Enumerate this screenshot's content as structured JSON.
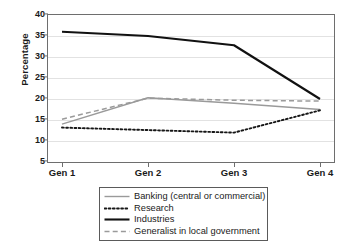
{
  "chart_data": {
    "type": "line",
    "title": "",
    "xlabel": "",
    "ylabel": "Percentage",
    "categories": [
      "Gen 1",
      "Gen 2",
      "Gen 3",
      "Gen 4"
    ],
    "ylim": [
      5,
      40
    ],
    "yticks": [
      5,
      10,
      15,
      20,
      25,
      30,
      35,
      40
    ],
    "ytick_labels": [
      "5",
      "10",
      "15",
      "20",
      "25",
      "30",
      "35",
      "40"
    ],
    "grid": true,
    "legend_position": "below-center",
    "series": [
      {
        "name": "Banking (central or commercial)",
        "values": [
          14.0,
          20.3,
          19.0,
          17.5
        ],
        "color": "#9a9a9a",
        "style": "solid",
        "width": 1.4
      },
      {
        "name": "Research",
        "values": [
          13.2,
          12.6,
          12.0,
          17.3
        ],
        "color": "#161616",
        "style": "dotted",
        "width": 1.9
      },
      {
        "name": "Industries",
        "values": [
          36.0,
          35.0,
          32.8,
          20.0
        ],
        "color": "#111111",
        "style": "solid",
        "width": 2.1
      },
      {
        "name": "Generalist in local government",
        "values": [
          15.2,
          20.2,
          19.7,
          19.5
        ],
        "color": "#9a9a9a",
        "style": "dashed",
        "width": 1.5
      }
    ]
  },
  "legend": {
    "items": [
      {
        "label": "Banking (central or commercial)"
      },
      {
        "label": "Research"
      },
      {
        "label": "Industries"
      },
      {
        "label": "Generalist in local government"
      }
    ]
  }
}
